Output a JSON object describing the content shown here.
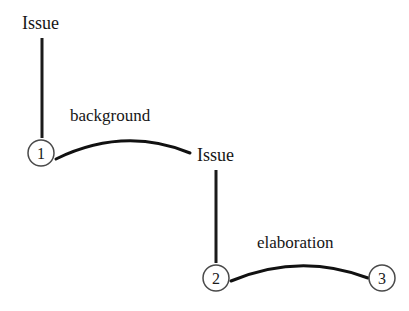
{
  "diagram": {
    "type": "rst-discourse-tree",
    "background_color": "#ffffff",
    "ink_color": "#161616",
    "nodes": [
      {
        "id": "n1",
        "label": "1",
        "cx": 41,
        "cy": 153,
        "r": 13
      },
      {
        "id": "n2",
        "label": "2",
        "cx": 216,
        "cy": 278,
        "r": 13
      },
      {
        "id": "n3",
        "label": "3",
        "cx": 382,
        "cy": 278,
        "r": 13
      }
    ],
    "nucleus_labels": [
      {
        "id": "issue-top",
        "text": "Issue",
        "x": 22,
        "y": 14
      },
      {
        "id": "issue-mid",
        "text": "Issue",
        "x": 197,
        "y": 146
      }
    ],
    "relation_labels": [
      {
        "id": "background",
        "text": "background",
        "x": 70,
        "y": 107
      },
      {
        "id": "elaboration",
        "text": "elaboration",
        "x": 257,
        "y": 234
      }
    ],
    "span_lines": [
      {
        "id": "span-issue-top-to-n1",
        "x1": 42,
        "y1": 38,
        "x2": 42,
        "y2": 138
      },
      {
        "id": "span-issue-mid-to-n2",
        "x1": 216,
        "y1": 170,
        "x2": 216,
        "y2": 263
      }
    ],
    "relation_arcs": [
      {
        "id": "arc-background",
        "from": "n1",
        "to": "issue-mid",
        "x1": 56,
        "y1": 159,
        "cx": 124,
        "cy": 126,
        "x2": 190,
        "y2": 153
      },
      {
        "id": "arc-elaboration",
        "from": "n2",
        "to": "n3",
        "x1": 231,
        "y1": 281,
        "cx": 300,
        "cy": 252,
        "x2": 368,
        "y2": 278
      }
    ]
  }
}
